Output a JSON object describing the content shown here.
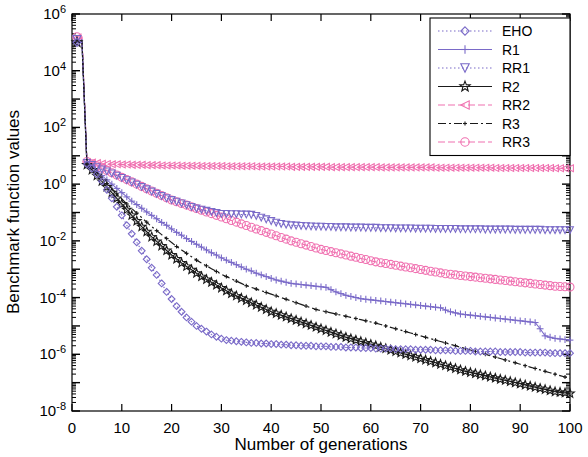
{
  "chart_data": {
    "type": "line",
    "title": "",
    "xlabel": "Number of generations",
    "ylabel": "Benchmark function values",
    "xlim": [
      0,
      100
    ],
    "ylim_log10": [
      -8,
      6
    ],
    "xticks": [
      0,
      10,
      20,
      30,
      40,
      50,
      60,
      70,
      80,
      90,
      100
    ],
    "xticklabels": [
      "0",
      "10",
      "20",
      "30",
      "40",
      "50",
      "60",
      "70",
      "80",
      "90",
      "100"
    ],
    "yticks_log10": [
      6,
      4,
      2,
      0,
      -2,
      -4,
      -6,
      -8
    ],
    "yticklabels": [
      "10^6",
      "10^4",
      "10^2",
      "10^0",
      "10^-2",
      "10^-4",
      "10^-6",
      "10^-8"
    ],
    "yscale": "log",
    "grid": false,
    "legend_position": "top-right",
    "legend_entries": [
      "EHO",
      "R1",
      "RR1",
      "R2",
      "RR2",
      "R3",
      "RR3"
    ],
    "colors": {
      "EHO": "#7a6ac8",
      "R1": "#7a6ac8",
      "RR1": "#7a6ac8",
      "R2": "#1a1a1a",
      "RR2": "#f070b0",
      "R3": "#1a1a1a",
      "RR3": "#f070b0"
    },
    "markers": {
      "EHO": "diamond",
      "R1": "plus",
      "RR1": "triangle-down",
      "R2": "star",
      "RR2": "triangle-left",
      "R3": "plus-small",
      "RR3": "circle"
    },
    "linestyles": {
      "EHO": "dotted",
      "R1": "solid",
      "RR1": "dotted",
      "R2": "solid",
      "RR2": "dashed",
      "R3": "dashdot",
      "RR3": "dashed"
    },
    "x": [
      1,
      2,
      3,
      4,
      5,
      6,
      7,
      8,
      9,
      10,
      11,
      12,
      13,
      14,
      15,
      16,
      17,
      18,
      19,
      20,
      21,
      22,
      23,
      24,
      25,
      26,
      27,
      28,
      29,
      30,
      31,
      32,
      33,
      34,
      35,
      36,
      37,
      38,
      39,
      40,
      41,
      42,
      43,
      44,
      45,
      46,
      47,
      48,
      49,
      50,
      51,
      52,
      53,
      54,
      55,
      56,
      57,
      58,
      59,
      60,
      61,
      62,
      63,
      64,
      65,
      66,
      67,
      68,
      69,
      70,
      71,
      72,
      73,
      74,
      75,
      76,
      77,
      78,
      79,
      80,
      81,
      82,
      83,
      84,
      85,
      86,
      87,
      88,
      89,
      90,
      91,
      92,
      93,
      94,
      95,
      96,
      97,
      98,
      99,
      100
    ],
    "series": [
      {
        "name": "EHO",
        "values_log10": [
          5.0,
          5.0,
          0.7,
          0.55,
          0.35,
          0.1,
          -0.2,
          -0.5,
          -0.8,
          -1.1,
          -1.45,
          -1.75,
          -2.05,
          -2.35,
          -2.65,
          -2.95,
          -3.2,
          -3.5,
          -3.8,
          -4.05,
          -4.3,
          -4.5,
          -4.7,
          -4.85,
          -5.0,
          -5.1,
          -5.2,
          -5.3,
          -5.38,
          -5.45,
          -5.5,
          -5.52,
          -5.54,
          -5.56,
          -5.58,
          -5.6,
          -5.6,
          -5.62,
          -5.62,
          -5.64,
          -5.64,
          -5.66,
          -5.66,
          -5.68,
          -5.68,
          -5.7,
          -5.7,
          -5.7,
          -5.72,
          -5.72,
          -5.72,
          -5.74,
          -5.74,
          -5.74,
          -5.76,
          -5.76,
          -5.76,
          -5.78,
          -5.78,
          -5.78,
          -5.8,
          -5.8,
          -5.8,
          -5.8,
          -5.82,
          -5.82,
          -5.82,
          -5.82,
          -5.84,
          -5.84,
          -5.84,
          -5.84,
          -5.86,
          -5.86,
          -5.86,
          -5.86,
          -5.88,
          -5.88,
          -5.88,
          -5.88,
          -5.9,
          -5.9,
          -5.9,
          -5.9,
          -5.9,
          -5.92,
          -5.92,
          -5.92,
          -5.92,
          -5.92,
          -5.94,
          -5.94,
          -5.94,
          -5.94,
          -5.94,
          -5.96,
          -5.96,
          -5.96,
          -5.96,
          -5.96
        ]
      },
      {
        "name": "R1",
        "values_log10": [
          5.05,
          5.05,
          0.72,
          0.6,
          0.45,
          0.3,
          0.15,
          0.0,
          -0.15,
          -0.3,
          -0.45,
          -0.6,
          -0.72,
          -0.85,
          -0.98,
          -1.1,
          -1.22,
          -1.35,
          -1.45,
          -1.58,
          -1.7,
          -1.8,
          -1.92,
          -2.02,
          -2.12,
          -2.22,
          -2.32,
          -2.42,
          -2.5,
          -2.6,
          -2.68,
          -2.76,
          -2.84,
          -2.92,
          -3.0,
          -3.06,
          -3.14,
          -3.2,
          -3.26,
          -3.32,
          -3.38,
          -3.42,
          -3.46,
          -3.5,
          -3.52,
          -3.54,
          -3.56,
          -3.58,
          -3.6,
          -3.62,
          -3.64,
          -3.72,
          -3.8,
          -3.86,
          -3.92,
          -3.96,
          -4.0,
          -4.04,
          -4.06,
          -4.08,
          -4.1,
          -4.12,
          -4.14,
          -4.16,
          -4.18,
          -4.2,
          -4.22,
          -4.24,
          -4.26,
          -4.28,
          -4.3,
          -4.32,
          -4.34,
          -4.36,
          -4.44,
          -4.5,
          -4.54,
          -4.58,
          -4.6,
          -4.62,
          -4.64,
          -4.66,
          -4.68,
          -4.7,
          -4.72,
          -4.74,
          -4.76,
          -4.78,
          -4.8,
          -4.82,
          -4.84,
          -4.86,
          -4.88,
          -5.1,
          -5.35,
          -5.4,
          -5.44,
          -5.46,
          -5.48,
          -5.5
        ]
      },
      {
        "name": "RR1",
        "values_log10": [
          5.1,
          5.1,
          0.75,
          0.68,
          0.6,
          0.52,
          0.45,
          0.38,
          0.3,
          0.22,
          0.14,
          0.06,
          -0.02,
          -0.1,
          -0.18,
          -0.26,
          -0.34,
          -0.42,
          -0.5,
          -0.56,
          -0.62,
          -0.68,
          -0.74,
          -0.8,
          -0.86,
          -0.9,
          -0.94,
          -0.98,
          -1.02,
          -1.05,
          -1.05,
          -1.06,
          -1.06,
          -1.07,
          -1.07,
          -1.08,
          -1.12,
          -1.18,
          -1.24,
          -1.3,
          -1.36,
          -1.4,
          -1.43,
          -1.45,
          -1.46,
          -1.47,
          -1.48,
          -1.49,
          -1.5,
          -1.5,
          -1.51,
          -1.51,
          -1.52,
          -1.52,
          -1.52,
          -1.53,
          -1.53,
          -1.53,
          -1.54,
          -1.54,
          -1.54,
          -1.55,
          -1.55,
          -1.55,
          -1.56,
          -1.56,
          -1.56,
          -1.56,
          -1.57,
          -1.57,
          -1.57,
          -1.57,
          -1.58,
          -1.58,
          -1.58,
          -1.58,
          -1.58,
          -1.59,
          -1.59,
          -1.59,
          -1.59,
          -1.59,
          -1.6,
          -1.6,
          -1.6,
          -1.6,
          -1.6,
          -1.6,
          -1.61,
          -1.61,
          -1.61,
          -1.61,
          -1.61,
          -1.61,
          -1.62,
          -1.62,
          -1.62,
          -1.62,
          -1.62,
          -1.62
        ]
      },
      {
        "name": "R2",
        "values_log10": [
          5.0,
          5.0,
          0.68,
          0.5,
          0.3,
          0.1,
          -0.1,
          -0.3,
          -0.5,
          -0.7,
          -0.9,
          -1.1,
          -1.3,
          -1.5,
          -1.68,
          -1.86,
          -2.02,
          -2.18,
          -2.34,
          -2.5,
          -2.64,
          -2.78,
          -2.9,
          -3.02,
          -3.14,
          -3.26,
          -3.36,
          -3.46,
          -3.56,
          -3.66,
          -3.76,
          -3.86,
          -3.94,
          -4.02,
          -4.1,
          -4.18,
          -4.26,
          -4.34,
          -4.42,
          -4.5,
          -4.56,
          -4.62,
          -4.68,
          -4.74,
          -4.8,
          -4.86,
          -4.92,
          -4.98,
          -5.04,
          -5.1,
          -5.16,
          -5.22,
          -5.28,
          -5.34,
          -5.4,
          -5.45,
          -5.5,
          -5.55,
          -5.6,
          -5.65,
          -5.7,
          -5.75,
          -5.8,
          -5.85,
          -5.9,
          -5.95,
          -6.0,
          -6.05,
          -6.1,
          -6.15,
          -6.2,
          -6.25,
          -6.3,
          -6.35,
          -6.4,
          -6.45,
          -6.5,
          -6.55,
          -6.6,
          -6.64,
          -6.68,
          -6.72,
          -6.76,
          -6.8,
          -6.84,
          -6.88,
          -6.92,
          -6.96,
          -7.0,
          -7.04,
          -7.08,
          -7.12,
          -7.16,
          -7.2,
          -7.24,
          -7.28,
          -7.32,
          -7.34,
          -7.36,
          -7.38
        ]
      },
      {
        "name": "RR2",
        "values_log10": [
          5.15,
          5.15,
          0.78,
          0.76,
          0.74,
          0.72,
          0.71,
          0.7,
          0.7,
          0.69,
          0.69,
          0.68,
          0.68,
          0.68,
          0.67,
          0.67,
          0.67,
          0.66,
          0.66,
          0.66,
          0.66,
          0.65,
          0.65,
          0.65,
          0.65,
          0.64,
          0.64,
          0.64,
          0.64,
          0.64,
          0.63,
          0.63,
          0.63,
          0.63,
          0.63,
          0.63,
          0.62,
          0.62,
          0.62,
          0.62,
          0.62,
          0.62,
          0.62,
          0.61,
          0.61,
          0.61,
          0.61,
          0.61,
          0.61,
          0.61,
          0.61,
          0.6,
          0.6,
          0.6,
          0.6,
          0.6,
          0.6,
          0.6,
          0.6,
          0.6,
          0.6,
          0.59,
          0.59,
          0.59,
          0.59,
          0.59,
          0.59,
          0.59,
          0.59,
          0.59,
          0.59,
          0.59,
          0.58,
          0.58,
          0.58,
          0.58,
          0.58,
          0.58,
          0.58,
          0.58,
          0.58,
          0.58,
          0.58,
          0.58,
          0.57,
          0.57,
          0.57,
          0.57,
          0.57,
          0.57,
          0.57,
          0.57,
          0.57,
          0.57,
          0.57,
          0.57,
          0.56,
          0.56,
          0.56,
          0.56
        ]
      },
      {
        "name": "R3",
        "values_log10": [
          5.05,
          5.05,
          0.7,
          0.55,
          0.38,
          0.2,
          0.02,
          -0.16,
          -0.34,
          -0.52,
          -0.7,
          -0.86,
          -1.02,
          -1.18,
          -1.34,
          -1.5,
          -1.64,
          -1.78,
          -1.92,
          -2.06,
          -2.2,
          -2.32,
          -2.44,
          -2.56,
          -2.68,
          -2.78,
          -2.88,
          -2.98,
          -3.08,
          -3.18,
          -3.26,
          -3.34,
          -3.42,
          -3.5,
          -3.58,
          -3.64,
          -3.7,
          -3.76,
          -3.82,
          -3.88,
          -3.94,
          -4.0,
          -4.06,
          -4.12,
          -4.18,
          -4.24,
          -4.3,
          -4.36,
          -4.42,
          -4.46,
          -4.5,
          -4.54,
          -4.58,
          -4.62,
          -4.66,
          -4.7,
          -4.74,
          -4.78,
          -4.82,
          -4.86,
          -4.9,
          -4.95,
          -5.0,
          -5.05,
          -5.1,
          -5.15,
          -5.2,
          -5.25,
          -5.3,
          -5.35,
          -5.4,
          -5.45,
          -5.5,
          -5.55,
          -5.6,
          -5.65,
          -5.7,
          -5.75,
          -5.8,
          -5.85,
          -5.9,
          -5.95,
          -6.0,
          -6.05,
          -6.1,
          -6.15,
          -6.2,
          -6.25,
          -6.3,
          -6.35,
          -6.4,
          -6.45,
          -6.5,
          -6.55,
          -6.6,
          -6.65,
          -6.7,
          -6.75,
          -6.8,
          -6.85
        ]
      },
      {
        "name": "RR3",
        "values_log10": [
          5.2,
          5.2,
          0.8,
          0.72,
          0.64,
          0.56,
          0.48,
          0.4,
          0.32,
          0.24,
          0.16,
          0.08,
          0.0,
          -0.08,
          -0.16,
          -0.24,
          -0.32,
          -0.4,
          -0.48,
          -0.56,
          -0.62,
          -0.68,
          -0.74,
          -0.8,
          -0.86,
          -0.92,
          -0.98,
          -1.04,
          -1.1,
          -1.16,
          -1.22,
          -1.28,
          -1.34,
          -1.4,
          -1.46,
          -1.52,
          -1.58,
          -1.64,
          -1.7,
          -1.76,
          -1.82,
          -1.88,
          -1.94,
          -2.0,
          -2.05,
          -2.1,
          -2.15,
          -2.2,
          -2.25,
          -2.3,
          -2.34,
          -2.38,
          -2.42,
          -2.46,
          -2.5,
          -2.54,
          -2.58,
          -2.62,
          -2.66,
          -2.7,
          -2.74,
          -2.77,
          -2.8,
          -2.83,
          -2.86,
          -2.89,
          -2.92,
          -2.95,
          -2.98,
          -3.01,
          -3.04,
          -3.07,
          -3.1,
          -3.13,
          -3.16,
          -3.18,
          -3.2,
          -3.22,
          -3.24,
          -3.26,
          -3.28,
          -3.3,
          -3.32,
          -3.34,
          -3.36,
          -3.38,
          -3.4,
          -3.42,
          -3.44,
          -3.46,
          -3.48,
          -3.5,
          -3.52,
          -3.54,
          -3.56,
          -3.58,
          -3.6,
          -3.61,
          -3.62,
          -3.63
        ]
      }
    ]
  },
  "legend": {
    "items": [
      {
        "label": "EHO"
      },
      {
        "label": "R1"
      },
      {
        "label": "RR1"
      },
      {
        "label": "R2"
      },
      {
        "label": "RR2"
      },
      {
        "label": "R3"
      },
      {
        "label": "RR3"
      }
    ]
  },
  "axes": {
    "xlabel": "Number of generations",
    "ylabel": "Benchmark function values"
  }
}
